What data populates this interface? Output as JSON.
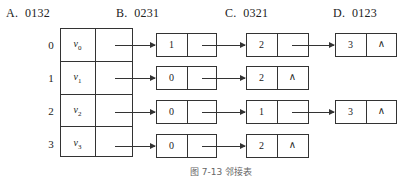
{
  "options": [
    {
      "letter": "A.",
      "value": "0132"
    },
    {
      "letter": "B.",
      "value": "0231"
    },
    {
      "letter": "C.",
      "value": "0321"
    },
    {
      "letter": "D.",
      "value": "0123"
    }
  ],
  "adjacency_list": {
    "vertices": [
      {
        "index": "0",
        "name": "v",
        "sub": "0",
        "edges": [
          "1",
          "2",
          "3"
        ]
      },
      {
        "index": "1",
        "name": "v",
        "sub": "1",
        "edges": [
          "0",
          "2"
        ]
      },
      {
        "index": "2",
        "name": "v",
        "sub": "2",
        "edges": [
          "0",
          "1",
          "3"
        ]
      },
      {
        "index": "3",
        "name": "v",
        "sub": "3",
        "edges": [
          "0",
          "2"
        ]
      }
    ],
    "null_symbol": "∧"
  },
  "caption": "图 7-13 邻接表"
}
